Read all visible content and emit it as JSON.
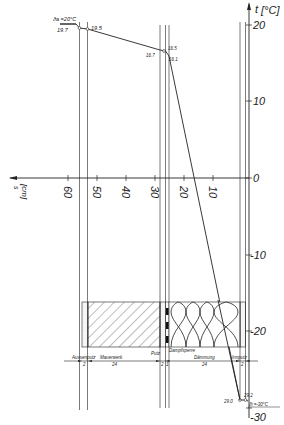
{
  "diagram": {
    "temperature_axis": {
      "label_symbol": "t",
      "unit": "[°C]",
      "ticks": [
        "20",
        "10",
        "0",
        "-10",
        "-20",
        "-30"
      ]
    },
    "thickness_axis": {
      "label_symbol": "s",
      "unit": "[cm]",
      "ticks": [
        "60",
        "50",
        "40",
        "30",
        "20",
        "10"
      ]
    },
    "boundary_conditions": {
      "outside_label": "ϑa =20°C",
      "inside_label": "ϑi =-30°C"
    },
    "temperature_points": {
      "p1": "19.7",
      "p2": "19.5",
      "p3": "16.7",
      "p4": "16.5",
      "p5": "16.1",
      "p6": "29.0",
      "p7": "29.2"
    },
    "layers": [
      {
        "name": "Aussenputz",
        "thickness": "2"
      },
      {
        "name": "Mauerwerk",
        "thickness": "24"
      },
      {
        "name": "Putz",
        "thickness": "2"
      },
      {
        "name": "Dampfsperre",
        "thickness": "1"
      },
      {
        "name": "Dämmung",
        "thickness": "24"
      },
      {
        "name": "Innputz",
        "thickness": "2"
      }
    ]
  }
}
